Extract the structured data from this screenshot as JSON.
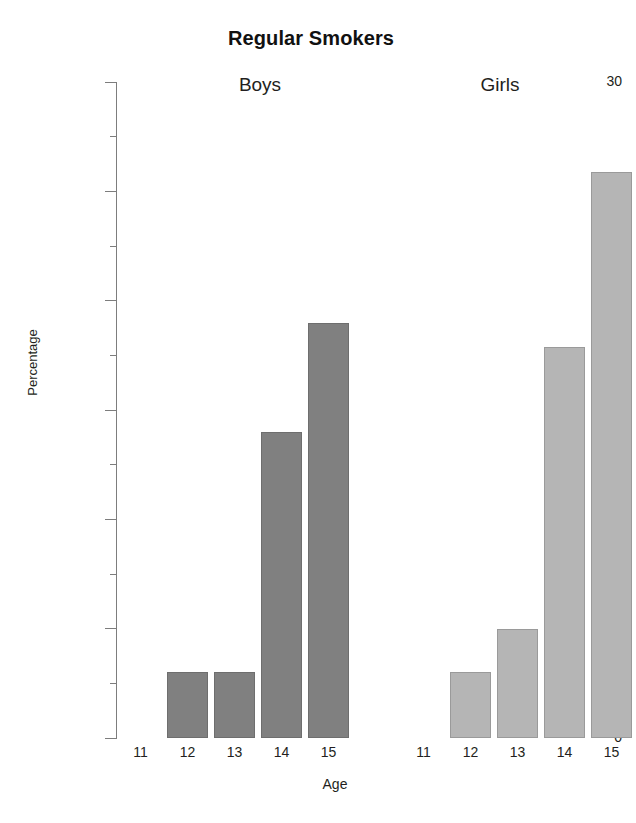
{
  "chart_data": {
    "type": "bar",
    "title": "Regular Smokers",
    "xlabel": "Age",
    "ylabel": "Percentage",
    "ylim": [
      0,
      30
    ],
    "y_major_ticks": [
      0,
      5,
      10,
      15,
      20,
      25,
      30
    ],
    "y_minor_ticks": [
      2.5,
      7.5,
      12.5,
      17.5,
      22.5,
      27.5
    ],
    "y_tick_labels": [
      "0",
      "5",
      "10",
      "15",
      "20",
      "25",
      "30"
    ],
    "grid": false,
    "legend": "none",
    "categories": [
      "11",
      "12",
      "13",
      "14",
      "15"
    ],
    "panels": [
      {
        "name": "Boys",
        "label": "Boys",
        "color": "#808080",
        "categories": [
          "11",
          "12",
          "13",
          "14",
          "15"
        ],
        "values": [
          0,
          3,
          3,
          14,
          19
        ]
      },
      {
        "name": "Girls",
        "label": "Girls",
        "color": "#b5b5b5",
        "categories": [
          "11",
          "12",
          "13",
          "14",
          "15"
        ],
        "values": [
          0,
          3,
          5,
          17.9,
          25.9
        ]
      }
    ],
    "series": [
      {
        "name": "Boys",
        "values": [
          0,
          3,
          3,
          14,
          19
        ]
      },
      {
        "name": "Girls",
        "values": [
          0,
          3,
          5,
          17.9,
          25.9
        ]
      }
    ]
  },
  "colors": {
    "boys_bar": "#808080",
    "girls_bar": "#b5b5b5",
    "axis": "#7d7d7d",
    "text": "#231f20",
    "background": "#ffffff"
  }
}
